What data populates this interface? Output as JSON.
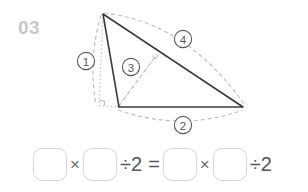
{
  "problem": {
    "number": "03"
  },
  "figure": {
    "labels": [
      {
        "id": "label-1",
        "text": "①",
        "x": 86,
        "y": 61
      },
      {
        "id": "label-2",
        "text": "②",
        "x": 183,
        "y": 125
      },
      {
        "id": "label-3",
        "text": "③",
        "x": 131,
        "y": 67
      },
      {
        "id": "label-4",
        "text": "④",
        "x": 183,
        "y": 39
      }
    ],
    "colors": {
      "solid_stroke": "#3a3d40",
      "dashed_stroke": "#b9bcc0",
      "dotted_stroke": "#c3c6ca",
      "label_text": "#55585b",
      "number_text": "#c6c9cc",
      "box_border": "#d4d7da"
    }
  },
  "equation": {
    "items": [
      {
        "kind": "box",
        "name": "answer-box-1",
        "value": ""
      },
      {
        "kind": "op",
        "name": "multiply-sign-1",
        "text": "×"
      },
      {
        "kind": "box",
        "name": "answer-box-2",
        "value": ""
      },
      {
        "kind": "op",
        "name": "divide-expression-1",
        "text": "÷2"
      },
      {
        "kind": "op",
        "name": "equals-sign",
        "text": "="
      },
      {
        "kind": "box",
        "name": "answer-box-3",
        "value": ""
      },
      {
        "kind": "op",
        "name": "multiply-sign-2",
        "text": "×"
      },
      {
        "kind": "box",
        "name": "answer-box-4",
        "value": ""
      },
      {
        "kind": "op",
        "name": "divide-expression-2",
        "text": "÷2"
      }
    ]
  }
}
